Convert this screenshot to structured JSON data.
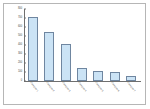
{
  "chart": {
    "type": "bar",
    "title": "",
    "xlabel": "",
    "ylabel": ""
  },
  "chart_data": {
    "type": "bar",
    "title": "",
    "subtitle": "",
    "xlabel": "",
    "ylabel": "",
    "grid": false,
    "legend": null,
    "legend_position": "none",
    "ylim": [
      0,
      800
    ],
    "ytick_labels": [
      "800",
      "700",
      "600",
      "500",
      "400",
      "300",
      "200",
      "100",
      "0"
    ],
    "ytick_values": [
      800,
      700,
      600,
      500,
      400,
      300,
      200,
      100,
      0
    ],
    "categories": [
      "Category 1",
      "Category 2",
      "Category 3",
      "Category 4",
      "Category 5",
      "Category 6",
      "Category 7"
    ],
    "values": [
      710,
      540,
      410,
      140,
      110,
      105,
      60
    ],
    "bar_fill_color": "#cbe3f5",
    "bar_border_color": "#6f86a0",
    "axis_color": "#6f6f6f",
    "frame_color": "#b6b6b6",
    "background_color": "#ffffff"
  }
}
